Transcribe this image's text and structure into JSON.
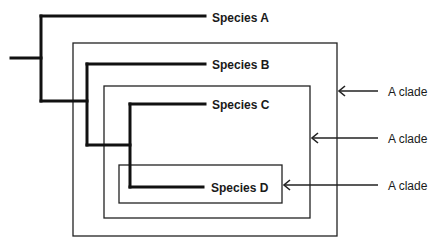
{
  "diagram": {
    "type": "cladogram",
    "species": [
      {
        "label": "Species A"
      },
      {
        "label": "Species B"
      },
      {
        "label": "Species C"
      },
      {
        "label": "Species D"
      }
    ],
    "clades": [
      {
        "label": "A clade",
        "encloses": [
          "Species B",
          "Species C",
          "Species D"
        ]
      },
      {
        "label": "A clade",
        "encloses": [
          "Species C",
          "Species D"
        ]
      },
      {
        "label": "A clade",
        "encloses": [
          "Species D"
        ]
      }
    ],
    "colors": {
      "line": "#111111",
      "box": "#222222",
      "background": "#ffffff"
    }
  }
}
